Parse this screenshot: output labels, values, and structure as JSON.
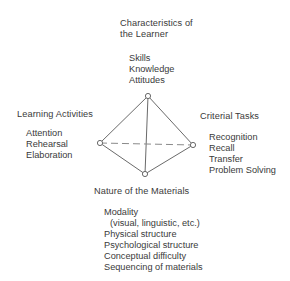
{
  "diagram": {
    "type": "tetrahedral model",
    "vertices": {
      "top": {
        "title_line1": "Characteristics of",
        "title_line2": "the Learner",
        "items": [
          "Skills",
          "Knowledge",
          "Attitudes"
        ]
      },
      "left": {
        "title": "Learning Activities",
        "items": [
          "Attention",
          "Rehearsal",
          "Elaboration"
        ]
      },
      "right": {
        "title": "Criterial Tasks",
        "items": [
          "Recognition",
          "Recall",
          "Transfer",
          "Problem Solving"
        ]
      },
      "bottom": {
        "title": "Nature of the Materials",
        "items": [
          "Modality",
          "(visual, linguistic, etc.)",
          "Physical structure",
          "Psychological structure",
          "Conceptual difficulty",
          "Sequencing of materials"
        ]
      }
    },
    "colors": {
      "line": "#6a6a6a",
      "text": "#3a3a3a",
      "background": "#ffffff"
    }
  }
}
